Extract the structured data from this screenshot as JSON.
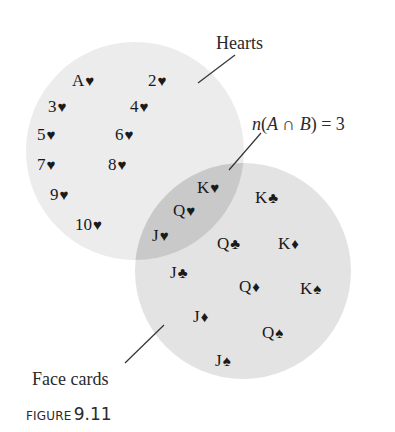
{
  "figure": {
    "caption_prefix": "FIGURE",
    "caption_number": "9.11"
  },
  "labels": {
    "hearts": "Hearts",
    "face_cards": "Face cards",
    "intersection_prefix": "n(",
    "intersection_set": "A ∩ B",
    "intersection_suffix": ") = 3"
  },
  "colors": {
    "hearts_fill": "#ececec",
    "face_fill": "#e3e3e3",
    "intersection_fill": "#c9c9c9",
    "leader_line": "#333333"
  },
  "sets": {
    "hearts_only": [
      {
        "rank": "A",
        "suit": "♥"
      },
      {
        "rank": "2",
        "suit": "♥"
      },
      {
        "rank": "3",
        "suit": "♥"
      },
      {
        "rank": "4",
        "suit": "♥"
      },
      {
        "rank": "5",
        "suit": "♥"
      },
      {
        "rank": "6",
        "suit": "♥"
      },
      {
        "rank": "7",
        "suit": "♥"
      },
      {
        "rank": "8",
        "suit": "♥"
      },
      {
        "rank": "9",
        "suit": "♥"
      },
      {
        "rank": "10",
        "suit": "♥"
      }
    ],
    "intersection": [
      {
        "rank": "K",
        "suit": "♥"
      },
      {
        "rank": "Q",
        "suit": "♥"
      },
      {
        "rank": "J",
        "suit": "♥"
      }
    ],
    "face_only": [
      {
        "rank": "K",
        "suit": "♣"
      },
      {
        "rank": "Q",
        "suit": "♣"
      },
      {
        "rank": "K",
        "suit": "♦"
      },
      {
        "rank": "J",
        "suit": "♣"
      },
      {
        "rank": "Q",
        "suit": "♦"
      },
      {
        "rank": "K",
        "suit": "♠"
      },
      {
        "rank": "J",
        "suit": "♦"
      },
      {
        "rank": "Q",
        "suit": "♠"
      },
      {
        "rank": "J",
        "suit": "♠"
      }
    ]
  }
}
